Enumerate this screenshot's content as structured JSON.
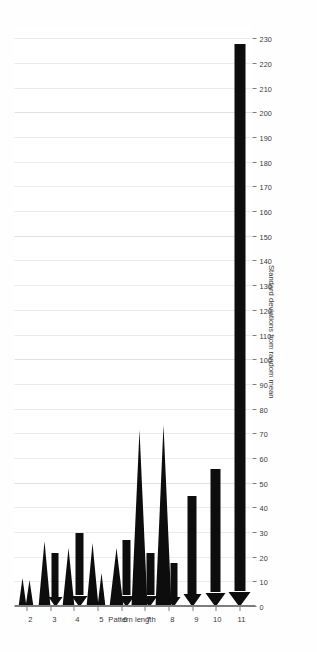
{
  "chart_data": {
    "type": "bar",
    "orientation": "horizontal-rotated",
    "title": "",
    "xlabel": "Pattern length",
    "ylabel": "Standard deviations from random mean",
    "categories": [
      2,
      3,
      4,
      5,
      6,
      7,
      8,
      9,
      10,
      11
    ],
    "x_tick_labels": [
      "2",
      "3",
      "4",
      "5",
      "6",
      "7",
      "8",
      "9",
      "10",
      "11"
    ],
    "y_tick_labels": [
      "0",
      "10",
      "20",
      "30",
      "40",
      "50",
      "60",
      "70",
      "80",
      "90",
      "100",
      "110",
      "120",
      "130",
      "140",
      "150",
      "160",
      "170",
      "180",
      "190",
      "200",
      "210",
      "220",
      "230"
    ],
    "ylim": [
      0,
      235
    ],
    "y_tick_step": 10,
    "grid": true,
    "legend": false,
    "legend_position": "none",
    "mark_color": "#0d0d0d",
    "grid_color": "#eceaea",
    "axis_color": "#7d7d7d",
    "series": [
      {
        "name": "Standard deviations from random mean",
        "values": [
          12,
          22,
          27,
          24,
          26,
          72,
          74,
          45,
          56,
          228
        ]
      }
    ],
    "marks": [
      {
        "category": 2,
        "value": 12,
        "shape": "spike",
        "offset": -0.16,
        "thickness": 9
      },
      {
        "category": 2,
        "value": 11,
        "shape": "spike",
        "offset": 0.16,
        "thickness": 9
      },
      {
        "category": 3,
        "value": 27,
        "shape": "spike",
        "offset": -0.2,
        "thickness": 13
      },
      {
        "category": 3,
        "value": 22,
        "shape": "arrow",
        "offset": 0.22,
        "thickness": 7
      },
      {
        "category": 4,
        "value": 24,
        "shape": "spike",
        "offset": -0.2,
        "thickness": 13
      },
      {
        "category": 4,
        "value": 30,
        "shape": "arrow",
        "offset": 0.24,
        "thickness": 8
      },
      {
        "category": 5,
        "value": 26,
        "shape": "spike",
        "offset": -0.18,
        "thickness": 13
      },
      {
        "category": 5,
        "value": 14,
        "shape": "spike",
        "offset": 0.2,
        "thickness": 9
      },
      {
        "category": 6,
        "value": 24,
        "shape": "spike",
        "offset": -0.2,
        "thickness": 14
      },
      {
        "category": 6,
        "value": 27,
        "shape": "arrow",
        "offset": 0.22,
        "thickness": 8
      },
      {
        "category": 7,
        "value": 72,
        "shape": "spike",
        "offset": -0.22,
        "thickness": 17
      },
      {
        "category": 7,
        "value": 22,
        "shape": "arrow",
        "offset": 0.22,
        "thickness": 8
      },
      {
        "category": 8,
        "value": 74,
        "shape": "spike",
        "offset": -0.2,
        "thickness": 17
      },
      {
        "category": 8,
        "value": 18,
        "shape": "arrow",
        "offset": 0.22,
        "thickness": 7
      },
      {
        "category": 9,
        "value": 45,
        "shape": "arrow",
        "offset": 0.0,
        "thickness": 9
      },
      {
        "category": 10,
        "value": 56,
        "shape": "arrow",
        "offset": 0.0,
        "thickness": 10
      },
      {
        "category": 11,
        "value": 228,
        "shape": "arrow",
        "offset": 0.0,
        "thickness": 11
      }
    ]
  },
  "axes": {
    "value_axis_title": "Standard deviations from random mean",
    "category_axis_title": "Pattern length"
  }
}
